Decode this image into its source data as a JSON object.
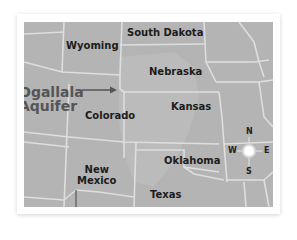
{
  "map": {
    "background_color": "#b4b4b4",
    "border_color": "#dcdcdc",
    "aquifer_color": "#c2c2c2",
    "states": [
      {
        "name": "South Dakota"
      },
      {
        "name": "Wyoming"
      },
      {
        "name": "Nebraska"
      },
      {
        "name": "Colorado"
      },
      {
        "name": "Kansas"
      },
      {
        "name": "New",
        "name_line2": "Mexico"
      },
      {
        "name": "Oklahoma"
      },
      {
        "name": "Texas"
      }
    ],
    "feature_label": {
      "line1": "Ogallala",
      "line2": "Aquifer",
      "arrow": "→"
    },
    "compass": {
      "north": "N",
      "south": "S",
      "east": "E",
      "west": "W"
    }
  }
}
